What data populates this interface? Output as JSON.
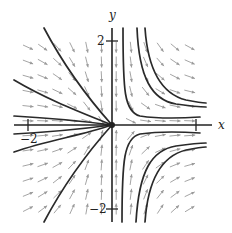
{
  "figure": {
    "type": "phase-portrait",
    "system": "x' = x^2, y' = -y",
    "axes": {
      "x_label": "x",
      "y_label": "y",
      "x_ticks": [
        {
          "value": -2,
          "label": "−2"
        },
        {
          "value": 2,
          "label": ""
        }
      ],
      "y_ticks": [
        {
          "value": 2,
          "label": "2"
        },
        {
          "value": -2,
          "label": "−2"
        }
      ],
      "x_range": [
        -2.3,
        2.4
      ],
      "y_range": [
        -2.3,
        2.3
      ]
    },
    "equilibrium": {
      "x": 0,
      "y": 0
    },
    "colors": {
      "trajectory": "#2a2a2a",
      "field_arrow": "#9a9a9a",
      "axis": "#222222"
    },
    "layout": {
      "origin_px": [
        112,
        125
      ],
      "unit_px": 42
    },
    "trajectories": [
      {
        "name": "left-upper-steep",
        "d": "M44,28 C62,62 86,96 112,125"
      },
      {
        "name": "left-upper-shallow",
        "d": "M14,80 C48,100 80,112 112,125"
      },
      {
        "name": "left-upper-near-axis",
        "d": "M14,116 C50,118 82,121 112,125"
      },
      {
        "name": "left-lower-near-axis",
        "d": "M14,134 C50,132 82,129 112,125"
      },
      {
        "name": "left-lower-shallow",
        "d": "M14,152 C48,140 80,136 112,125"
      },
      {
        "name": "left-lower-steep",
        "d": "M44,222 C62,188 86,154 112,125"
      },
      {
        "name": "right-upper-1",
        "d": "M123,28 C123,90 124,112 140,116 C160,119 185,118 200,117"
      },
      {
        "name": "right-upper-2",
        "d": "M137,28 C139,78 152,100 176,104 C190,106 200,107 206,107"
      },
      {
        "name": "right-upper-3",
        "d": "M145,28 C148,72 162,94 186,100 C196,102 202,103 206,103"
      },
      {
        "name": "right-lower-1",
        "d": "M122,222 C122,160 124,138 140,134 C160,131 185,132 200,133"
      },
      {
        "name": "right-lower-2",
        "d": "M136,222 C139,170 152,150 176,146 C190,144 200,143 206,143"
      },
      {
        "name": "right-lower-3",
        "d": "M145,222 C148,178 162,156 186,150 C196,148 202,147 206,147"
      }
    ],
    "field_grid": {
      "x_min": -2.0,
      "x_max": 2.0,
      "y_min": -2.0,
      "y_max": 2.0,
      "step": 0.35,
      "arrow_len_px": 11
    }
  }
}
